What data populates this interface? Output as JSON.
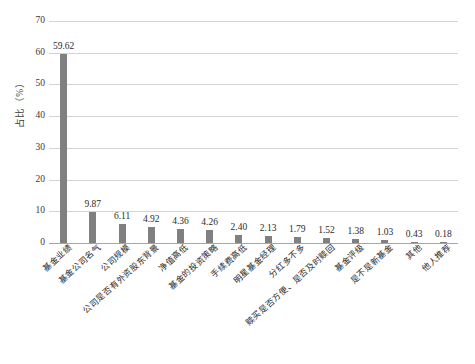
{
  "chart_data": {
    "type": "bar",
    "title": "",
    "subtitle": "",
    "xlabel": "",
    "ylabel": "占比（%）",
    "ylim": [
      0,
      70
    ],
    "ytick_step": 10,
    "yticks": [
      "0",
      "10",
      "20",
      "30",
      "40",
      "50",
      "60",
      "70"
    ],
    "grid": true,
    "legend": false,
    "bar_color": "#808080",
    "gridline_color": "#d4d4d4",
    "categories": [
      "基金业绩",
      "基金公司名气",
      "公司规模",
      "公司是否有外资股东背景",
      "净值高低",
      "基金的投资策略",
      "手续费高低",
      "明星基金经理",
      "分红多不多",
      "赎买是否方便、是否及时赎回",
      "基金评级",
      "是不是新基金",
      "其他",
      "他人推荐"
    ],
    "values": [
      59.62,
      9.87,
      6.11,
      4.92,
      4.36,
      4.26,
      2.4,
      2.13,
      1.79,
      1.52,
      1.38,
      1.03,
      0.43,
      0.18
    ],
    "value_labels": [
      "59.62",
      "9.87",
      "6.11",
      "4.92",
      "4.36",
      "4.26",
      "2.40",
      "2.13",
      "1.79",
      "1.52",
      "1.38",
      "1.03",
      "0.43",
      "0.18"
    ]
  }
}
